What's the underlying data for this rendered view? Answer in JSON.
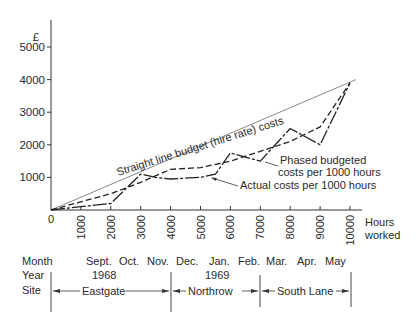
{
  "chart_data": {
    "type": "line",
    "title": "",
    "xlabel": "Hours worked",
    "ylabel": "£",
    "xlim": [
      0,
      10000
    ],
    "ylim": [
      0,
      5000
    ],
    "x_ticks": [
      0,
      1000,
      2000,
      3000,
      4000,
      5000,
      6000,
      7000,
      8000,
      9000,
      10000
    ],
    "x_tick_labels": [
      "0",
      "1000",
      "2000",
      "3000",
      "4000",
      "5000",
      "6000",
      "7000",
      "8000",
      "9000",
      "10000"
    ],
    "y_ticks": [
      1000,
      2000,
      3000,
      4000,
      5000
    ],
    "y_tick_labels": [
      "1000",
      "2000",
      "3000",
      "4000",
      "5000"
    ],
    "grid": false,
    "series": [
      {
        "name": "Straight line budget (hire rate) costs",
        "style": "thin-solid",
        "x": [
          0,
          10200
        ],
        "values": [
          0,
          4000
        ]
      },
      {
        "name": "Phased budgeted costs per 1000 hours",
        "style": "dashed",
        "x": [
          0,
          1000,
          2000,
          3000,
          4000,
          5000,
          6000,
          7000,
          8000,
          9000,
          10000
        ],
        "values": [
          0,
          250,
          500,
          850,
          1250,
          1300,
          1500,
          1800,
          2100,
          2550,
          3900
        ]
      },
      {
        "name": "Actual costs per 1000 hours",
        "style": "solid-dash-dot",
        "x": [
          0,
          1000,
          2000,
          3000,
          3500,
          4000,
          5000,
          5500,
          6000,
          7000,
          8000,
          9000,
          10000
        ],
        "values": [
          0,
          100,
          200,
          1100,
          1000,
          950,
          1000,
          1100,
          1750,
          1500,
          2500,
          2000,
          3900
        ]
      }
    ],
    "annotations": [
      "Straight line budget (hire rate) costs",
      "Phased budgeted costs per 1000 hours",
      "Actual costs per 1000 hours"
    ]
  },
  "labels": {
    "currency": "£",
    "origin": "0",
    "x_axis_line1": "Hours",
    "x_axis_line2": "worked",
    "straight_line": "Straight line budget (hire rate) costs",
    "phased_line1": "Phased  budgeted",
    "phased_line2": "costs per 1000 hours",
    "actual": "Actual  costs per 1000 hours"
  },
  "timeline": {
    "month_label": "Month",
    "year_label": "Year",
    "site_label": "Site",
    "months": [
      "Sept.",
      "Oct.",
      "Nov.",
      "Dec.",
      "Jan.",
      "Feb.",
      "Mar.",
      "Apr.",
      "May"
    ],
    "years": [
      "1968",
      "1969"
    ],
    "sites": [
      "Eastgate",
      "Northrow",
      "South Lane"
    ]
  }
}
